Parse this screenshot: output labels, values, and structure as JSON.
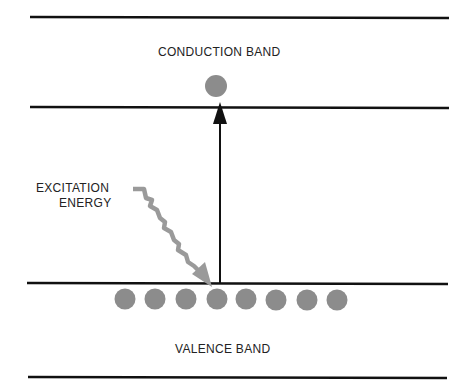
{
  "diagram": {
    "labels": {
      "conduction_band": "CONDUCTION BAND",
      "valence_band": "VALENCE BAND",
      "excitation_line1": "EXCITATION",
      "excitation_line2": "ENERGY"
    },
    "colors": {
      "line": "#111111",
      "electron": "#8c8c8c",
      "wavy_arrow": "#9a9a9a"
    },
    "valence_electrons": 8,
    "conduction_electrons": 1
  }
}
